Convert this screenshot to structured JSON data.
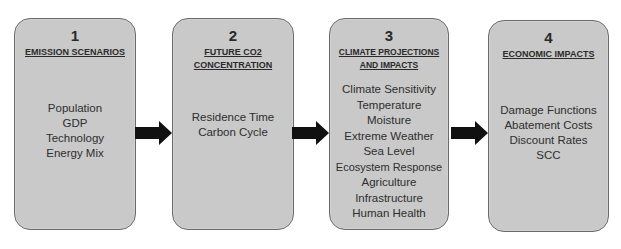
{
  "diagram": {
    "steps": [
      {
        "number": "1",
        "title_lines": [
          "Emission Scenarios"
        ],
        "items": [
          "Population",
          "GDP",
          "Technology",
          "Energy Mix"
        ]
      },
      {
        "number": "2",
        "title_lines": [
          "Future CO2",
          "Concentration"
        ],
        "items": [
          "Residence Time",
          "Carbon Cycle"
        ]
      },
      {
        "number": "3",
        "title_lines": [
          "Climate Projections",
          "and Impacts"
        ],
        "items": [
          "Climate Sensitivity",
          "Temperature",
          "Moisture",
          "Extreme Weather",
          "Sea Level",
          "Ecosystem Response",
          "Agriculture",
          "Infrastructure",
          "Human Health"
        ]
      },
      {
        "number": "4",
        "title_lines": [
          "Economic Impacts"
        ],
        "items": [
          "Damage Functions",
          "Abatement Costs",
          "Discount Rates",
          "SCC"
        ]
      }
    ],
    "arrows": [
      {
        "from": "1",
        "to": "2",
        "icon": "right-arrow-icon"
      },
      {
        "from": "2",
        "to": "3",
        "icon": "right-arrow-icon"
      },
      {
        "from": "3",
        "to": "4",
        "icon": "right-arrow-icon"
      }
    ],
    "colors": {
      "box_fill": "#c9c9c9",
      "box_border": "#6b6b6b",
      "arrow": "#111111",
      "text": "#2b2b2b"
    }
  }
}
